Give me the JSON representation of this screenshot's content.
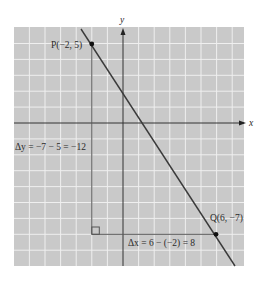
{
  "diagram": {
    "type": "coordinate-plane",
    "colors": {
      "grid_background": "#c9c9c9",
      "grid_lines": "#eeeeee",
      "axes": "#333333",
      "line": "#3a3a3a",
      "triangle": "#555555",
      "points": "#111111"
    },
    "axes": {
      "x_label": "x",
      "y_label": "y"
    },
    "points": [
      {
        "name": "P",
        "x": -2,
        "y": 5,
        "label": "P(−2, 5)"
      },
      {
        "name": "Q",
        "x": 6,
        "y": -7,
        "label": "Q(6, −7)"
      }
    ],
    "line": {
      "slope": -1.5,
      "intercept": 2
    },
    "annotations": {
      "delta_y": "Δy = −7 − 5 = −12",
      "delta_x": "Δx = 6 − (−2) = 8"
    }
  }
}
